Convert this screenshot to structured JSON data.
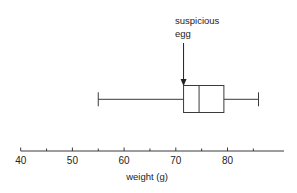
{
  "chart_data": {
    "type": "boxplot",
    "title": "",
    "xlabel": "weight (g)",
    "ylabel": "",
    "xlim": [
      40,
      91
    ],
    "x_ticks": {
      "major": [
        40,
        50,
        60,
        70,
        80
      ],
      "minor": [
        45,
        55,
        65,
        75,
        85
      ],
      "labels": [
        "40",
        "50",
        "60",
        "70",
        "80"
      ]
    },
    "grid": false,
    "series": [
      {
        "name": "egg weights",
        "min": 55,
        "q1": 71.5,
        "median": 74.5,
        "q3": 79.3,
        "max": 86
      }
    ],
    "annotations": [
      {
        "lines": [
          "suspicious",
          "egg"
        ],
        "points_to_value": 71.5,
        "arrow": true
      }
    ]
  },
  "colors": {
    "stroke": "#3a3a3a",
    "text": "#222222",
    "background": "#ffffff"
  }
}
